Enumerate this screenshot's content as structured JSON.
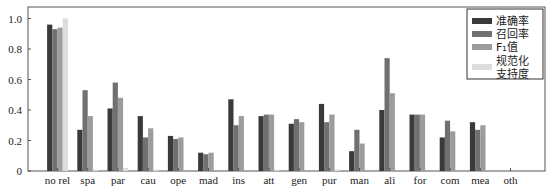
{
  "chart_data": {
    "type": "bar",
    "title": "",
    "xlabel": "",
    "ylabel": "",
    "ylim": [
      0,
      1.05
    ],
    "yticks": [
      0,
      0.2,
      0.4,
      0.6,
      0.8,
      1.0
    ],
    "ytick_labels": [
      "0",
      "0.2",
      "0.4",
      "0.6",
      "0.8",
      "1.0"
    ],
    "grid": false,
    "legend_position": "upper right",
    "categories": [
      "no rel",
      "spa",
      "par",
      "cau",
      "ope",
      "mad",
      "ins",
      "att",
      "gen",
      "pur",
      "man",
      "ali",
      "for",
      "com",
      "mea",
      "oth"
    ],
    "series": [
      {
        "name": "准确率",
        "color": "#3a3a3a",
        "values": [
          0.96,
          0.27,
          0.41,
          0.36,
          0.23,
          0.12,
          0.47,
          0.36,
          0.31,
          0.44,
          0.13,
          0.4,
          0.37,
          0.22,
          0.32,
          0.0
        ]
      },
      {
        "name": "召回率",
        "color": "#707070",
        "values": [
          0.93,
          0.53,
          0.58,
          0.22,
          0.21,
          0.11,
          0.3,
          0.37,
          0.34,
          0.32,
          0.27,
          0.74,
          0.37,
          0.33,
          0.27,
          0.0
        ]
      },
      {
        "name": "F1值",
        "color": "#9c9c9c",
        "values": [
          0.94,
          0.36,
          0.48,
          0.28,
          0.22,
          0.12,
          0.36,
          0.37,
          0.32,
          0.37,
          0.18,
          0.51,
          0.37,
          0.26,
          0.3,
          0.0
        ]
      },
      {
        "name": "规范化支持度",
        "color": "#dcdcdc",
        "values": [
          1.0,
          0.01,
          0.02,
          0.01,
          0.0,
          0.0,
          0.0,
          0.01,
          0.0,
          0.01,
          0.0,
          0.0,
          0.0,
          0.0,
          0.0,
          0.0
        ]
      }
    ]
  },
  "legend": {
    "items": [
      {
        "label_lines": [
          "准确率"
        ],
        "color": "#3a3a3a"
      },
      {
        "label_lines": [
          "召回率"
        ],
        "color": "#707070"
      },
      {
        "label_lines": [
          "F₁值"
        ],
        "color": "#9c9c9c"
      },
      {
        "label_lines": [
          "规范化",
          "支持度"
        ],
        "color": "#dcdcdc"
      }
    ]
  }
}
